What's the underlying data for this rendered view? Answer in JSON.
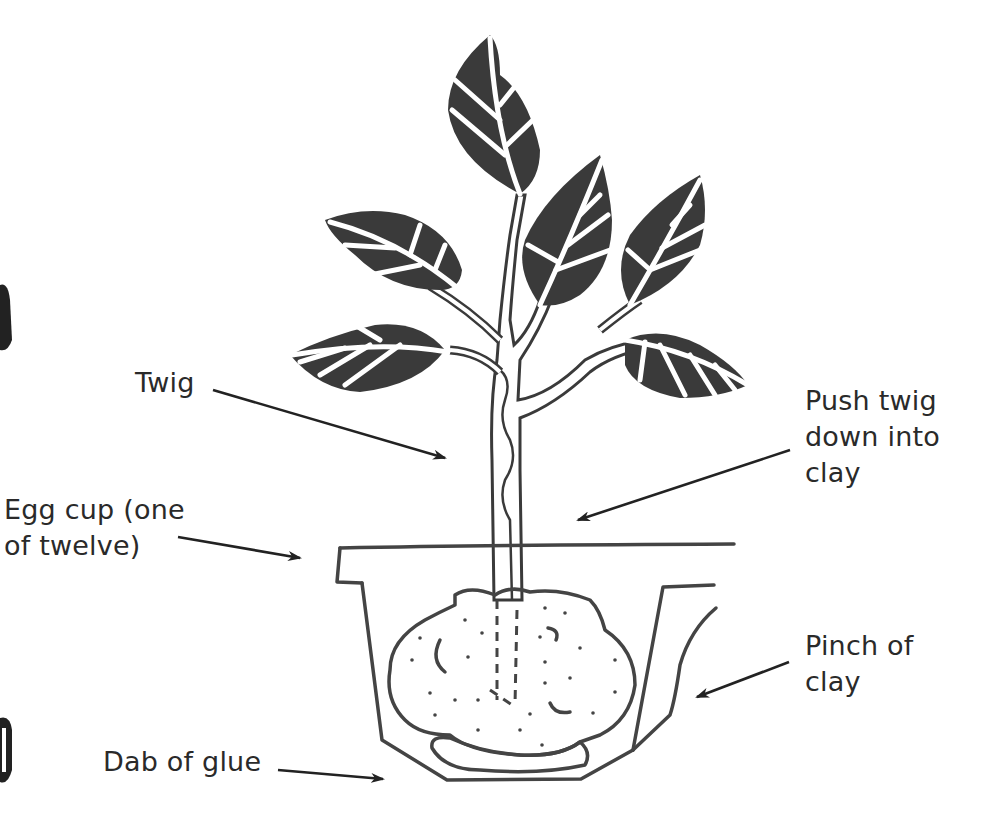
{
  "labels": {
    "twig": "Twig",
    "push": "Push twig\ndown into\nclay",
    "egg_cup": "Egg cup (one\nof twelve)",
    "pinch": "Pinch of\nclay",
    "glue": "Dab of glue"
  },
  "arrows": [
    {
      "name": "twig-arrow",
      "from": [
        213,
        390
      ],
      "to": [
        445,
        458
      ]
    },
    {
      "name": "push-arrow",
      "from": [
        790,
        450
      ],
      "to": [
        578,
        520
      ]
    },
    {
      "name": "egg-cup-arrow",
      "from": [
        178,
        537
      ],
      "to": [
        300,
        558
      ]
    },
    {
      "name": "pinch-arrow",
      "from": [
        789,
        662
      ],
      "to": [
        697,
        697
      ]
    },
    {
      "name": "glue-arrow",
      "from": [
        278,
        770
      ],
      "to": [
        383,
        779
      ]
    }
  ],
  "colors": {
    "ink": "#3a3a3a",
    "background": "#ffffff",
    "text": "#2a2a2a"
  }
}
